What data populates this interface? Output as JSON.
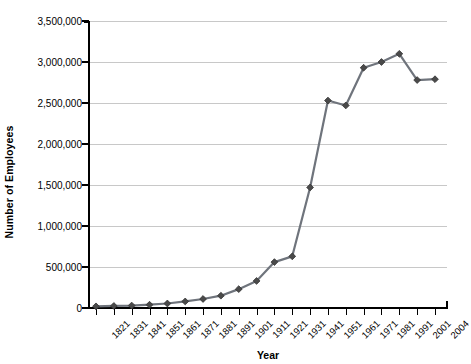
{
  "chart_data": {
    "type": "line",
    "title": "",
    "xlabel": "Year",
    "ylabel": "Number of Employees",
    "grid": true,
    "legend": false,
    "ylim": [
      0,
      3500000
    ],
    "ytick_values": [
      0,
      500000,
      1000000,
      1500000,
      2000000,
      2500000,
      3000000,
      3500000
    ],
    "ytick_labels": [
      "0",
      "500,000",
      "1,000,000",
      "1,500,000",
      "2,000,000",
      "2,500,000",
      "3,000,000",
      "3,500,000"
    ],
    "categories": [
      "1821",
      "1831",
      "1841",
      "1851",
      "1861",
      "1871",
      "1881",
      "1891",
      "1901",
      "1911",
      "1921",
      "1931",
      "1941",
      "1951",
      "1961",
      "1971",
      "1981",
      "1991",
      "2001",
      "2004"
    ],
    "values": [
      20000,
      25000,
      30000,
      40000,
      55000,
      80000,
      110000,
      150000,
      230000,
      330000,
      560000,
      630000,
      1470000,
      2530000,
      2470000,
      2930000,
      3000000,
      3100000,
      2780000,
      2790000
    ],
    "series": [
      {
        "name": "Number of Employees",
        "line_color": "#6f747c",
        "marker_color": "#4a4a4a",
        "marker": "diamond",
        "values": [
          20000,
          25000,
          30000,
          40000,
          55000,
          80000,
          110000,
          150000,
          230000,
          330000,
          560000,
          630000,
          1470000,
          2530000,
          2470000,
          2930000,
          3000000,
          3100000,
          2780000,
          2790000
        ]
      }
    ]
  },
  "style": {
    "grid_color": "#c8c8c8",
    "axis_color": "#000000",
    "background": "#ffffff",
    "line_color": "#6f747c",
    "marker_color": "#4a4a4a"
  }
}
